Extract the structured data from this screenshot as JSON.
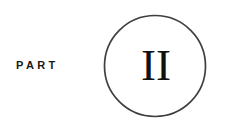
{
  "page": {
    "kind": "book-part-divider",
    "background_color": "#ffffff"
  },
  "label": {
    "text": "PART",
    "color": "#1a1a1a"
  },
  "badge": {
    "numeral": "II",
    "numeral_color": "#111111",
    "ring_color": "#3f3f3f",
    "ring_fill": "#ffffff",
    "ring_stroke_width": "1.7",
    "center_x": "52",
    "center_y": "52",
    "radius": "50.5"
  }
}
